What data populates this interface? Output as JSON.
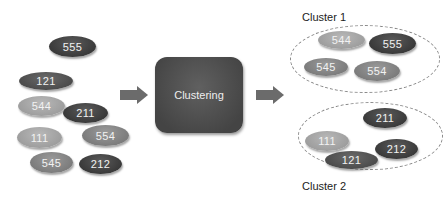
{
  "input_nodes": [
    {
      "label": "555",
      "shade": "dark"
    },
    {
      "label": "121",
      "shade": "darkmid"
    },
    {
      "label": "544",
      "shade": "light"
    },
    {
      "label": "211",
      "shade": "dark"
    },
    {
      "label": "111",
      "shade": "light"
    },
    {
      "label": "554",
      "shade": "mid"
    },
    {
      "label": "545",
      "shade": "mid"
    },
    {
      "label": "212",
      "shade": "dark"
    }
  ],
  "process": {
    "label": "Clustering"
  },
  "clusters": [
    {
      "title": "Cluster 1",
      "nodes": [
        "544",
        "555",
        "545",
        "554"
      ]
    },
    {
      "title": "Cluster 2",
      "nodes": [
        "211",
        "111",
        "121",
        "212"
      ]
    }
  ],
  "colors": {
    "dark": "#3f3f3f",
    "darkmid": "#555555",
    "mid": "#858585",
    "light": "#a6a6a6",
    "arrow": "#6b6b6b"
  }
}
